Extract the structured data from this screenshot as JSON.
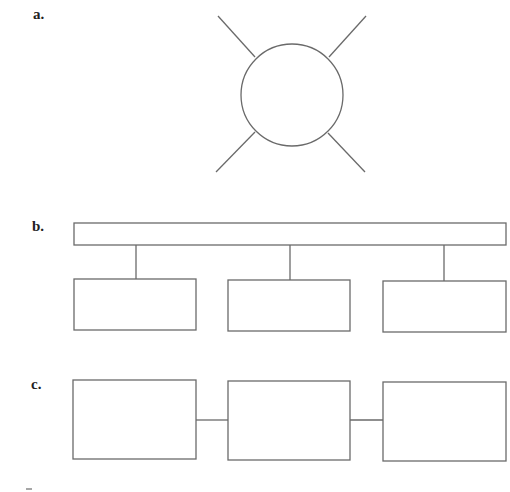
{
  "panels": [
    {
      "id": "a",
      "label": "a.",
      "type": "star",
      "description": "circle hub with four radial spokes"
    },
    {
      "id": "b",
      "label": "b.",
      "type": "bus",
      "description": "horizontal bus bar with three boxes connected below"
    },
    {
      "id": "c",
      "label": "c.",
      "type": "chain",
      "description": "three boxes connected in a horizontal chain"
    }
  ],
  "colors": {
    "stroke": "#6a6a6a",
    "label": "#222222",
    "background": "#ffffff"
  }
}
